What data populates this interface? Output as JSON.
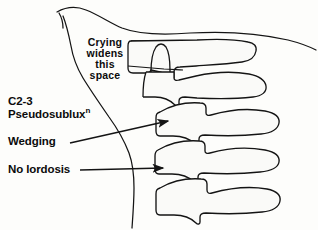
{
  "figure": {
    "background_color": "#fdfdfb",
    "ink_color": "#141414",
    "bone_fill_color": "#fafaf8",
    "width": 318,
    "height": 230
  },
  "annotations": {
    "crying": {
      "line1": "Crying",
      "line2": "widens",
      "line3": "this",
      "line4": "space"
    },
    "c2_3": "C2-3",
    "pseudosublux": "Pseudosublux",
    "pseudosublux_superscript": "n",
    "wedging": "Wedging",
    "no_lordosis": "No lordosis"
  },
  "leaders": {
    "wedging_arrow": "arrow-pointing-right-to-c3-vertebral-body",
    "no_lordosis_arrow": "arrow-pointing-right-to-c4-vertebral-body"
  },
  "structures": {
    "soft_tissue_profile": "neck-and-chin-outline",
    "mandible_line": "jaw-outline",
    "vertebrae": [
      "c1-c2-odontoid-complex",
      "c2-body-with-dens",
      "c3-vertebral-body",
      "c4-vertebral-body",
      "c5-vertebral-body"
    ]
  }
}
